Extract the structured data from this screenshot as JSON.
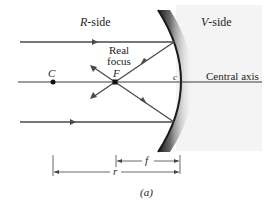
{
  "figure": {
    "caption": "(a)",
    "colors": {
      "ray": "#4a4a4a",
      "axis": "#3a3a3a",
      "mirror_edge": "#1a1a1a",
      "v_side_bg": "#f4f4f4",
      "text": "#231f20"
    }
  },
  "labels": {
    "r_side_letter": "R",
    "r_side_suffix": "-side",
    "v_side_letter": "V",
    "v_side_suffix": "-side",
    "real_focus_line1": "Real",
    "real_focus_line2": "focus",
    "focus_point": "F",
    "center_point": "C",
    "mirror_center": "c",
    "central_axis": "Central axis",
    "focal_length": "f",
    "radius": "r"
  },
  "geometry": {
    "central_axis_y": 82,
    "center_C": {
      "x": 53,
      "y": 82
    },
    "focus_F": {
      "x": 115,
      "y": 82
    },
    "mirror_vertex": {
      "x": 180,
      "y": 82
    },
    "incident_rays": [
      {
        "y": 42,
        "hit": {
          "x": 174,
          "y": 42
        }
      },
      {
        "y": 122,
        "hit": {
          "x": 174,
          "y": 122
        }
      }
    ]
  }
}
